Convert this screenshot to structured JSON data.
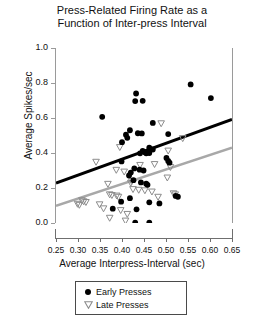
{
  "chart_data": {
    "type": "scatter",
    "title": "Press-Related Firing Rate as a Function of Inter-press Interval",
    "title_lines": [
      "Press-Related Firing Rate as a",
      "Function of Inter-press Interval"
    ],
    "xlabel": "Average Interpress-Interval (sec)",
    "ylabel": "Average Spikes/sec",
    "xlim": [
      0.25,
      0.65
    ],
    "ylim": [
      0.0,
      1.0
    ],
    "xticks": [
      0.25,
      0.3,
      0.35,
      0.4,
      0.45,
      0.5,
      0.55,
      0.6,
      0.65
    ],
    "xticklabels": [
      "0.25",
      "0.30",
      "0.35",
      "0.40",
      "0.45",
      "0.50",
      "0.55",
      "0.60",
      "0.65"
    ],
    "yticks": [
      0.0,
      0.2,
      0.4,
      0.6,
      0.8,
      1.0
    ],
    "yticklabels": [
      "0.0",
      "0.2",
      "0.4",
      "0.6",
      "0.8",
      "1.0"
    ],
    "grid": false,
    "legend_position": "below-axes",
    "series": [
      {
        "name": "Early Presses",
        "marker": "filled-circle",
        "color": "#000000",
        "points": [
          [
            0.355,
            0.607
          ],
          [
            0.432,
            0.74
          ],
          [
            0.43,
            0.697
          ],
          [
            0.447,
            0.698
          ],
          [
            0.556,
            0.792
          ],
          [
            0.602,
            0.714
          ],
          [
            0.47,
            0.572
          ],
          [
            0.418,
            0.53
          ],
          [
            0.409,
            0.505
          ],
          [
            0.412,
            0.487
          ],
          [
            0.436,
            0.513
          ],
          [
            0.445,
            0.512
          ],
          [
            0.505,
            0.508
          ],
          [
            0.4,
            0.462
          ],
          [
            0.462,
            0.43
          ],
          [
            0.47,
            0.42
          ],
          [
            0.447,
            0.412
          ],
          [
            0.452,
            0.405
          ],
          [
            0.455,
            0.398
          ],
          [
            0.462,
            0.4
          ],
          [
            0.441,
            0.398
          ],
          [
            0.399,
            0.352
          ],
          [
            0.501,
            0.372
          ],
          [
            0.505,
            0.355
          ],
          [
            0.508,
            0.345
          ],
          [
            0.428,
            0.312
          ],
          [
            0.44,
            0.305
          ],
          [
            0.449,
            0.3
          ],
          [
            0.42,
            0.288
          ],
          [
            0.416,
            0.272
          ],
          [
            0.426,
            0.245
          ],
          [
            0.443,
            0.232
          ],
          [
            0.455,
            0.225
          ],
          [
            0.458,
            0.218
          ],
          [
            0.522,
            0.155
          ],
          [
            0.527,
            0.15
          ],
          [
            0.418,
            0.142
          ],
          [
            0.398,
            0.122
          ],
          [
            0.462,
            0.118
          ],
          [
            0.485,
            0.112
          ],
          [
            0.379,
            0.082
          ],
          [
            0.433,
            0.078
          ],
          [
            0.43,
            0.002
          ],
          [
            0.462,
            0.002
          ]
        ]
      },
      {
        "name": "Late Presses",
        "marker": "open-down-triangle",
        "color": "#8c8c8c",
        "points": [
          [
            0.489,
            0.568
          ],
          [
            0.538,
            0.483
          ],
          [
            0.395,
            0.432
          ],
          [
            0.505,
            0.412
          ],
          [
            0.341,
            0.348
          ],
          [
            0.474,
            0.335
          ],
          [
            0.441,
            0.33
          ],
          [
            0.51,
            0.318
          ],
          [
            0.387,
            0.302
          ],
          [
            0.405,
            0.292
          ],
          [
            0.503,
            0.258
          ],
          [
            0.422,
            0.238
          ],
          [
            0.42,
            0.228
          ],
          [
            0.368,
            0.222
          ],
          [
            0.425,
            0.192
          ],
          [
            0.438,
            0.188
          ],
          [
            0.452,
            0.185
          ],
          [
            0.468,
            0.178
          ],
          [
            0.517,
            0.168
          ],
          [
            0.521,
            0.162
          ],
          [
            0.372,
            0.162
          ],
          [
            0.377,
            0.158
          ],
          [
            0.388,
            0.155
          ],
          [
            0.392,
            0.148
          ],
          [
            0.482,
            0.148
          ],
          [
            0.309,
            0.128
          ],
          [
            0.313,
            0.122
          ],
          [
            0.318,
            0.118
          ],
          [
            0.299,
            0.108
          ],
          [
            0.303,
            0.102
          ],
          [
            0.349,
            0.105
          ],
          [
            0.358,
            0.082
          ],
          [
            0.397,
            0.072
          ],
          [
            0.412,
            0.05
          ],
          [
            0.408,
            0.012
          ],
          [
            0.372,
            0.028
          ]
        ]
      }
    ],
    "trend_lines": [
      {
        "name": "Early Presses trend",
        "color": "#000000",
        "x": [
          0.25,
          0.65
        ],
        "y": [
          0.228,
          0.592
        ],
        "width": 3
      },
      {
        "name": "Late Presses trend",
        "color": "#a8a8a8",
        "x": [
          0.25,
          0.65
        ],
        "y": [
          0.098,
          0.43
        ],
        "width": 2.5
      }
    ],
    "legend": [
      {
        "label": "Early Presses",
        "marker": "filled-circle",
        "color": "#000000"
      },
      {
        "label": "Late Presses",
        "marker": "open-down-triangle",
        "color": "#8c8c8c"
      }
    ]
  }
}
